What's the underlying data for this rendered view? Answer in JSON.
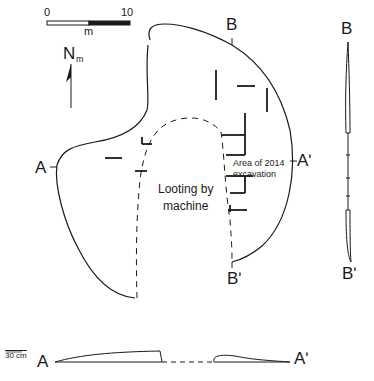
{
  "figure": {
    "scale_bar": {
      "start_label": "0",
      "end_label": "10",
      "unit": "m"
    },
    "north_arrow": {
      "label": "N",
      "subscript": "m"
    },
    "plan": {
      "section_labels": {
        "a": "A",
        "a_prime": "Aʹ",
        "b": "B",
        "b_prime": "Bʹ"
      },
      "looting_label_line1": "Looting by",
      "looting_label_line2": "machine",
      "excavation_label_line1": "Area of 2014",
      "excavation_label_line2": "excavation"
    },
    "section_b": {
      "top_label": "B",
      "bottom_label": "Bʹ"
    },
    "section_a": {
      "left_label": "A",
      "right_label": "Aʹ",
      "vertical_scale": "30 cm"
    },
    "colors": {
      "line": "#1a1a1a",
      "background": "#ffffff"
    }
  }
}
